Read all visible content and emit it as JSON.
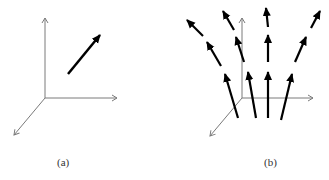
{
  "panels": [
    {
      "id": "a",
      "caption": "(a)",
      "description": "Single vector in 3D coordinate system"
    },
    {
      "id": "b",
      "caption": "(b)",
      "description": "Vector field of diverging arrows in 3D coordinate system"
    }
  ],
  "colors": {
    "axis": "#7a7a7a",
    "vector": "#000000",
    "background": "#ffffff"
  }
}
